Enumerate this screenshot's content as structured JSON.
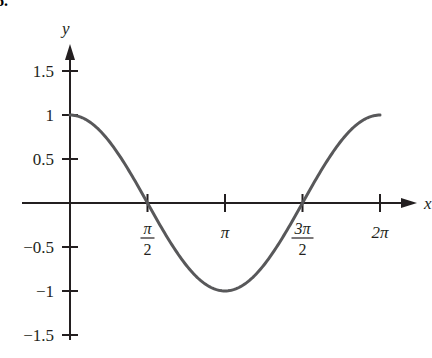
{
  "problem_number": "6.",
  "chart_data": {
    "type": "line",
    "title": "",
    "function": "cos(x)",
    "xlabel": "x",
    "ylabel": "y",
    "xlim": [
      0,
      6.2832
    ],
    "ylim": [
      -1.5,
      1.5
    ],
    "x_ticks": [
      {
        "value": 1.5708,
        "label_num": "π",
        "label_den": "2",
        "fraction": true
      },
      {
        "value": 3.1416,
        "label": "π",
        "fraction": false
      },
      {
        "value": 4.7124,
        "label_num": "3π",
        "label_den": "2",
        "fraction": true
      },
      {
        "value": 6.2832,
        "label": "2π",
        "fraction": false
      }
    ],
    "y_ticks": [
      {
        "value": 1.5,
        "label": "1.5"
      },
      {
        "value": 1,
        "label": "1"
      },
      {
        "value": 0.5,
        "label": "0.5"
      },
      {
        "value": -0.5,
        "label": "−0.5"
      },
      {
        "value": -1,
        "label": "−1"
      },
      {
        "value": -1.5,
        "label": "−1.5"
      }
    ],
    "series": [
      {
        "name": "y = cos x",
        "x": [
          0,
          0.7854,
          1.5708,
          2.3562,
          3.1416,
          3.927,
          4.7124,
          5.4978,
          6.2832
        ],
        "y": [
          1,
          0.7071,
          0,
          -0.7071,
          -1,
          -0.7071,
          0,
          0.7071,
          1
        ],
        "color": "#58585a"
      }
    ],
    "grid": false,
    "legend": null
  },
  "colors": {
    "axis": "#231f20",
    "curve": "#58585a"
  }
}
